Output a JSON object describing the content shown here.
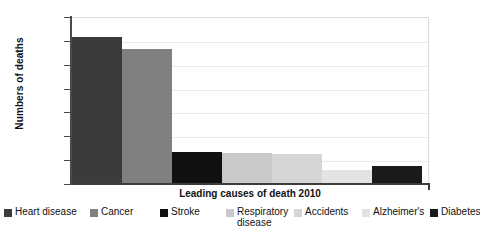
{
  "chart_data": {
    "type": "bar",
    "title": "",
    "xlabel": "Leading causes of death 2010",
    "ylabel": "Numbers of deaths",
    "categories": [
      "Heart disease",
      "Cancer",
      "Stroke",
      "Respiratory disease",
      "Accidents",
      "Alzheimer's",
      "Diabetes"
    ],
    "values": [
      610000,
      560000,
      130000,
      125000,
      120000,
      55000,
      70000
    ],
    "series": [
      {
        "name": "Leading causes of death 2010",
        "values": [
          610000,
          560000,
          130000,
          125000,
          120000,
          55000,
          70000
        ]
      }
    ],
    "ylim": [
      0,
      700000
    ],
    "ytick_values": [
      700000,
      600000,
      500000,
      400000,
      300000,
      200000,
      100000,
      0
    ],
    "ytick_labels": [
      "700,000",
      "600,000",
      "500,000",
      "400,000",
      "300,000",
      "200,000",
      "100,000",
      "0"
    ],
    "grid": true,
    "legend_position": "bottom",
    "bar_colors": [
      "#3b3b3b",
      "#808080",
      "#111111",
      "#c9c9c9",
      "#d6d6d6",
      "#e3e3e3",
      "#1a1a1a"
    ],
    "legend": [
      {
        "label": "Heart disease",
        "color": "#3b3b3b"
      },
      {
        "label": "Cancer",
        "color": "#808080"
      },
      {
        "label": "Stroke",
        "color": "#111111"
      },
      {
        "label": "Respiratory disease",
        "color": "#c9c9c9"
      },
      {
        "label": "Accidents",
        "color": "#d6d6d6"
      },
      {
        "label": "Alzheimer's",
        "color": "#e3e3e3"
      },
      {
        "label": "Diabetes",
        "color": "#1a1a1a"
      }
    ]
  }
}
